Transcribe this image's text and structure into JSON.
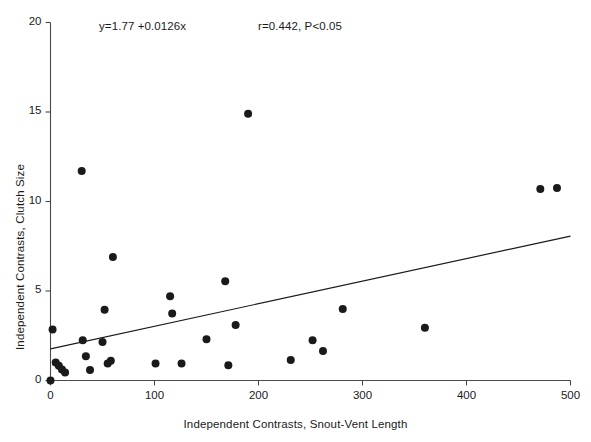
{
  "chart_data": {
    "type": "scatter",
    "title": "",
    "xlabel": "Independent Contrasts, Snout-Vent Length",
    "ylabel": "Independent Contrasts, Clutch Size",
    "xlim": [
      0,
      500
    ],
    "ylim": [
      0,
      20
    ],
    "xticks": [
      0,
      100,
      200,
      300,
      400,
      500
    ],
    "yticks": [
      0,
      5,
      10,
      15,
      20
    ],
    "grid": false,
    "legend": null,
    "marker": {
      "shape": "circle",
      "color": "#1a1a1a",
      "size": 5.4
    },
    "annotations": [
      {
        "name": "equation",
        "text": "y=1.77 +0.0126x",
        "x": 55,
        "y": 19.1
      },
      {
        "name": "statistics",
        "text": "r=0.442, P<0.05",
        "x": 240,
        "y": 19.1
      }
    ],
    "fit_line": {
      "label": "regression-line",
      "intercept": 1.77,
      "slope": 0.0126,
      "x_start": 0,
      "x_end": 500,
      "y_start": 1.77,
      "y_end": 8.07,
      "color": "#1a1a1a"
    },
    "points": [
      {
        "x": 0,
        "y": 0.0
      },
      {
        "x": 2,
        "y": 2.85
      },
      {
        "x": 5,
        "y": 1.0
      },
      {
        "x": 8,
        "y": 0.82
      },
      {
        "x": 11,
        "y": 0.62
      },
      {
        "x": 14,
        "y": 0.45
      },
      {
        "x": 30,
        "y": 11.7
      },
      {
        "x": 31,
        "y": 2.25
      },
      {
        "x": 34,
        "y": 1.35
      },
      {
        "x": 38,
        "y": 0.58
      },
      {
        "x": 50,
        "y": 2.15
      },
      {
        "x": 52,
        "y": 3.95
      },
      {
        "x": 55,
        "y": 0.95
      },
      {
        "x": 58,
        "y": 1.1
      },
      {
        "x": 60,
        "y": 6.9
      },
      {
        "x": 101,
        "y": 0.95
      },
      {
        "x": 126,
        "y": 0.95
      },
      {
        "x": 115,
        "y": 4.7
      },
      {
        "x": 117,
        "y": 3.75
      },
      {
        "x": 150,
        "y": 2.3
      },
      {
        "x": 168,
        "y": 5.55
      },
      {
        "x": 171,
        "y": 0.85
      },
      {
        "x": 178,
        "y": 3.1
      },
      {
        "x": 190,
        "y": 14.9
      },
      {
        "x": 231,
        "y": 1.15
      },
      {
        "x": 252,
        "y": 2.25
      },
      {
        "x": 262,
        "y": 1.65
      },
      {
        "x": 281,
        "y": 4.0
      },
      {
        "x": 360,
        "y": 2.95
      },
      {
        "x": 471,
        "y": 10.7
      },
      {
        "x": 487,
        "y": 10.75
      }
    ]
  }
}
